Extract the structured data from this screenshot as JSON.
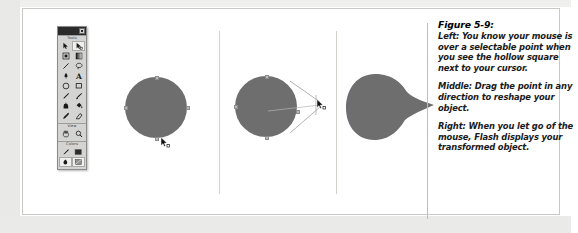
{
  "figure": {
    "number": "Figure 5-9:",
    "paragraphs": [
      "Left: You know your mouse is over a selectable point when you see the hollow square next to your cursor.",
      "Middle: Drag the point in any direction to reshape your object.",
      "Right: When you let go of the mouse, Flash displays your transformed object."
    ]
  },
  "toolbar": {
    "sections": [
      {
        "label": "Tools",
        "tools": [
          {
            "name": "arrow-select-tool",
            "icon": "arrow-icon",
            "selected": false
          },
          {
            "name": "subselect-tool",
            "icon": "white-arrow-icon",
            "selected": true
          },
          {
            "name": "free-transform-tool",
            "icon": "transform-box-icon",
            "selected": false
          },
          {
            "name": "fill-transform-tool",
            "icon": "gradient-box-icon",
            "selected": false
          },
          {
            "name": "line-tool",
            "icon": "line-icon",
            "selected": false
          },
          {
            "name": "lasso-tool",
            "icon": "lasso-icon",
            "selected": false
          },
          {
            "name": "pen-tool",
            "icon": "pen-icon",
            "selected": false
          },
          {
            "name": "text-tool",
            "icon": "text-a-icon",
            "selected": false
          },
          {
            "name": "oval-tool",
            "icon": "oval-icon",
            "selected": false
          },
          {
            "name": "rectangle-tool",
            "icon": "rectangle-icon",
            "selected": false
          },
          {
            "name": "pencil-tool",
            "icon": "pencil-icon",
            "selected": false
          },
          {
            "name": "brush-tool",
            "icon": "brush-icon",
            "selected": false
          },
          {
            "name": "ink-bottle-tool",
            "icon": "ink-bottle-icon",
            "selected": false
          },
          {
            "name": "paint-bucket-tool",
            "icon": "paint-bucket-icon",
            "selected": false
          },
          {
            "name": "eyedropper-tool",
            "icon": "eyedropper-icon",
            "selected": false
          },
          {
            "name": "eraser-tool",
            "icon": "eraser-icon",
            "selected": false
          }
        ]
      },
      {
        "label": "View",
        "tools": [
          {
            "name": "hand-tool",
            "icon": "hand-icon",
            "selected": false
          },
          {
            "name": "zoom-tool",
            "icon": "magnifier-icon",
            "selected": false
          }
        ]
      },
      {
        "label": "Colors",
        "tools": [
          {
            "name": "stroke-color-swatch",
            "icon": "pencil-stroke-icon",
            "selected": false
          },
          {
            "name": "fill-color-swatch",
            "icon": "fill-swatch-icon",
            "selected": false
          },
          {
            "name": "black-and-white-button",
            "icon": "black-white-icon",
            "selected": false
          },
          {
            "name": "no-color-button",
            "icon": "no-color-icon",
            "selected": false
          }
        ]
      }
    ],
    "close_button": "close-box"
  },
  "canvas": {
    "panels": [
      {
        "name": "panel-left-hover",
        "shape": "circle",
        "shape_color": "#6e6e6e",
        "cursor": "arrow-with-hollow-square"
      },
      {
        "name": "panel-middle-drag",
        "shape": "circle-with-drag-guides",
        "shape_color": "#6e6e6e",
        "cursor": "arrow-with-hollow-square"
      },
      {
        "name": "panel-right-result",
        "shape": "teardrop",
        "shape_color": "#6e6e6e",
        "cursor": "none"
      }
    ]
  }
}
